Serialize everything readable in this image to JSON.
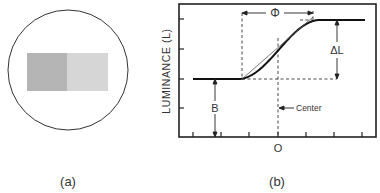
{
  "panel_a": {
    "caption": "(a)",
    "left_patch_color": "#b5b5b5",
    "right_patch_color": "#d6d6d6"
  },
  "panel_b": {
    "caption": "(b)",
    "ylabel": "LUMINANCE (L)",
    "x_origin_label": "O",
    "phase_label": "Φ",
    "delta_label": "ΔL",
    "base_label": "B",
    "center_label": "Center"
  },
  "chart_data": {
    "type": "line",
    "title": "",
    "xlabel": "",
    "ylabel": "LUMINANCE (L)",
    "x_tick_labels": [
      "",
      "",
      "",
      "O",
      "",
      "",
      ""
    ],
    "curve": "sigmoid luminance ramp from base B to B+ΔL, centered at 0",
    "annotations": [
      "Φ",
      "ΔL",
      "B",
      "Center"
    ]
  }
}
